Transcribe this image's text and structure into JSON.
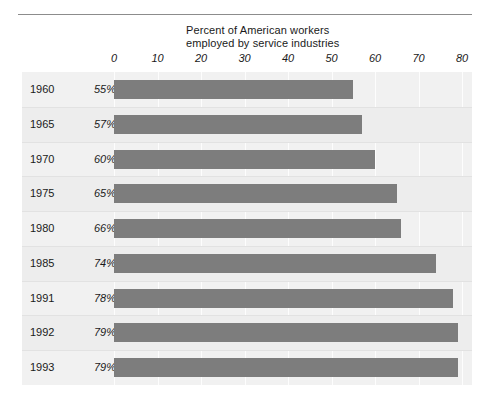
{
  "chart_data": {
    "type": "bar",
    "orientation": "horizontal",
    "title": "Percent of American workers employed by service industries",
    "title_lines": [
      "Percent of American workers",
      "employed by service industries"
    ],
    "xlabel": "",
    "ylabel": "",
    "categories": [
      "1960",
      "1965",
      "1970",
      "1975",
      "1980",
      "1985",
      "1991",
      "1992",
      "1993"
    ],
    "values": [
      55,
      57,
      60,
      65,
      66,
      74,
      78,
      79,
      79
    ],
    "value_labels": [
      "55%",
      "57%",
      "60%",
      "65%",
      "66%",
      "74%",
      "78%",
      "79%",
      "79%"
    ],
    "xlim": [
      0,
      80
    ],
    "xticks": [
      0,
      10,
      20,
      30,
      40,
      50,
      60,
      70,
      80
    ],
    "xtick_labels": [
      "0",
      "10",
      "20",
      "30",
      "40",
      "50",
      "60",
      "70",
      "80"
    ],
    "grid": true,
    "legend": false,
    "bar_color": "#7d7d7d",
    "panel_color": "#f1f1f1",
    "rule_color": "#8c8c8c"
  },
  "rows": [
    {
      "year": "1960",
      "pct": "55%",
      "value": 55
    },
    {
      "year": "1965",
      "pct": "57%",
      "value": 57
    },
    {
      "year": "1970",
      "pct": "60%",
      "value": 60
    },
    {
      "year": "1975",
      "pct": "65%",
      "value": 65
    },
    {
      "year": "1980",
      "pct": "66%",
      "value": 66
    },
    {
      "year": "1985",
      "pct": "74%",
      "value": 74
    },
    {
      "year": "1991",
      "pct": "78%",
      "value": 78
    },
    {
      "year": "1992",
      "pct": "79%",
      "value": 79
    },
    {
      "year": "1993",
      "pct": "79%",
      "value": 79
    }
  ]
}
